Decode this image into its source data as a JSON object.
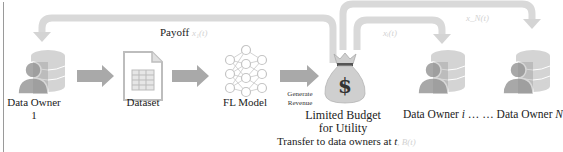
{
  "diagram": {
    "nodes": {
      "owner_1": {
        "label_line1": "Data Owner",
        "label_line2": "1"
      },
      "dataset": {
        "label": "Dataset"
      },
      "fl_model": {
        "label": "FL Model"
      },
      "budget": {
        "label_line1": "Limited Budget",
        "label_line2": "for Utility"
      },
      "owner_i": {
        "label_prefix": "Data Owner ",
        "label_var": "i",
        "label_ellipsis": " … … "
      },
      "owner_n": {
        "label_prefix": "Data Owner ",
        "label_var": "N"
      }
    },
    "edges": {
      "generate_revenue": {
        "line1": "Generate",
        "line2": "Revenue"
      },
      "payoff": {
        "label": "Payoff",
        "math": "x₁(t)"
      },
      "to_owner_i": {
        "math": "xᵢ(t)"
      },
      "to_owner_n": {
        "math": "x_N(t)"
      }
    },
    "caption": {
      "prefix": "Transfer to data owners at ",
      "var": "t",
      "math": ", B(t)"
    },
    "colors": {
      "arrow": "#a9a9a9",
      "feedback_arrow": "#d9d9d9",
      "icon_light": "#d4d4d4",
      "icon_dark": "#a0a0a0",
      "text": "#222222"
    }
  }
}
